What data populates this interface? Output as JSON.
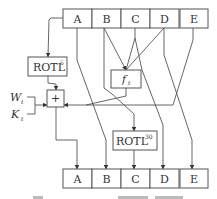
{
  "diagram": {
    "inputs": [
      {
        "id": "A",
        "label": "A"
      },
      {
        "id": "B",
        "label": "B"
      },
      {
        "id": "C",
        "label": "C"
      },
      {
        "id": "D",
        "label": "D"
      },
      {
        "id": "E",
        "label": "E"
      }
    ],
    "outputs": [
      {
        "id": "A",
        "label": "A"
      },
      {
        "id": "B",
        "label": "B"
      },
      {
        "id": "C",
        "label": "C"
      },
      {
        "id": "D",
        "label": "D"
      },
      {
        "id": "E",
        "label": "E"
      }
    ],
    "rotl5": {
      "base": "ROTL",
      "exp": "5"
    },
    "rotl30": {
      "base": "ROTL",
      "exp": "30"
    },
    "f": {
      "base": "f",
      "sub": "t"
    },
    "adder": {
      "label": "+"
    },
    "w": {
      "base": "W",
      "sub": "t"
    },
    "k": {
      "base": "K",
      "sub": "t"
    },
    "edges": [
      {
        "from": "A",
        "to": "ROTL5"
      },
      {
        "from": "ROTL5",
        "to": "+"
      },
      {
        "from": "W_t",
        "to": "+"
      },
      {
        "from": "K_t",
        "to": "+"
      },
      {
        "from": "B",
        "to": "f_t"
      },
      {
        "from": "C",
        "to": "f_t"
      },
      {
        "from": "D",
        "to": "f_t"
      },
      {
        "from": "f_t",
        "to": "+"
      },
      {
        "from": "E",
        "to": "+"
      },
      {
        "from": "+",
        "to": "A_out"
      },
      {
        "from": "A",
        "to": "B_out"
      },
      {
        "from": "B",
        "to": "ROTL30"
      },
      {
        "from": "ROTL30",
        "to": "C_out"
      },
      {
        "from": "C",
        "to": "D_out"
      },
      {
        "from": "D",
        "to": "E_out"
      }
    ]
  }
}
